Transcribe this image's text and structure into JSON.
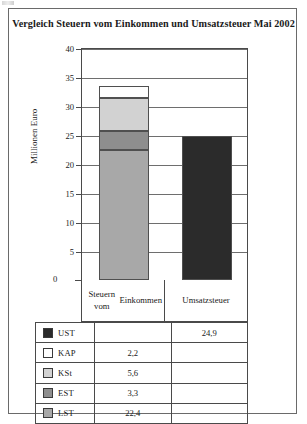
{
  "title": "Vergleich Steuern vom Einkommen und Umsatzsteuer Mai 2002",
  "axis": {
    "y_title": "Millionen Euro"
  },
  "legend": {
    "rows": [
      {
        "name": "UST",
        "color": "#2b2b2b",
        "v1": "",
        "v2": "24,9"
      },
      {
        "name": "KAP",
        "color": "#fdfdfd",
        "v1": "2,2",
        "v2": ""
      },
      {
        "name": "KSt",
        "color": "#d2d2d2",
        "v1": "5,6",
        "v2": ""
      },
      {
        "name": "EST",
        "color": "#8e8e8e",
        "v1": "3,3",
        "v2": ""
      },
      {
        "name": "LST",
        "color": "#a8a8a8",
        "v1": "22,4",
        "v2": ""
      }
    ]
  },
  "chart_data": {
    "type": "bar",
    "subtype": "stacked-column",
    "title": "Vergleich Steuern vom Einkommen und Umsatzsteuer Mai 2002",
    "xlabel": "",
    "ylabel": "Millionen Euro",
    "ylim": [
      0,
      40
    ],
    "yticks": [
      0,
      5,
      10,
      15,
      20,
      25,
      30,
      35,
      40
    ],
    "ytick_labels": [
      "0",
      "5",
      "10",
      "15",
      "20",
      "25",
      "30",
      "35",
      "40"
    ],
    "grid": true,
    "legend_position": "bottom-table",
    "categories": [
      "Steuern vom Einkommen",
      "Umsatzsteuer"
    ],
    "category_lines": [
      [
        "Steuern vom",
        "Einkommen"
      ],
      [
        "Umsatzsteuer"
      ]
    ],
    "series": [
      {
        "name": "LST",
        "color": "#a8a8a8",
        "values": [
          22.4,
          0
        ]
      },
      {
        "name": "EST",
        "color": "#8e8e8e",
        "values": [
          3.3,
          0
        ]
      },
      {
        "name": "KSt",
        "color": "#d2d2d2",
        "values": [
          5.6,
          0
        ]
      },
      {
        "name": "KAP",
        "color": "#fdfdfd",
        "values": [
          2.2,
          0
        ]
      },
      {
        "name": "UST",
        "color": "#2b2b2b",
        "values": [
          0,
          24.9
        ]
      }
    ],
    "stack_order_bottom_to_top": [
      "LST",
      "EST",
      "KSt",
      "KAP"
    ],
    "totals": [
      33.5,
      24.9
    ]
  }
}
